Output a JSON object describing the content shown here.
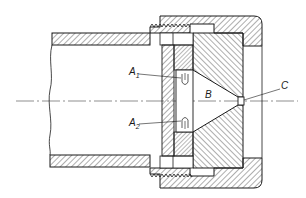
{
  "figure": {
    "type": "technical cross-section drawing",
    "labels": {
      "a1": {
        "main": "A",
        "sub": "1"
      },
      "a2": {
        "main": "A",
        "sub": "2"
      },
      "b": "B",
      "c": "C"
    },
    "colors": {
      "line": "#1a1a1a",
      "hatch": "#333333",
      "background": "#ffffff"
    }
  }
}
